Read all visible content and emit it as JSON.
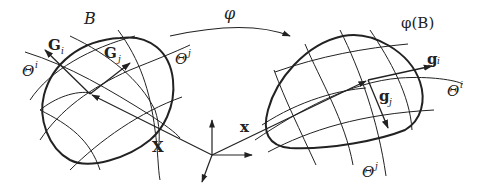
{
  "diagram": {
    "type": "continuum-mechanics-mapping",
    "colors": {
      "stroke": "#222222",
      "background": "#ffffff"
    },
    "reference_body": {
      "label": "B",
      "base_vectors": [
        {
          "label": "G",
          "sub": "i"
        },
        {
          "label": "G",
          "sub": "j"
        }
      ],
      "coord_lines": [
        {
          "label": "Θ",
          "sup": "i"
        },
        {
          "label": "Θ",
          "sup": "j"
        }
      ],
      "position_vector": "X"
    },
    "mapping": {
      "label": "φ"
    },
    "current_body": {
      "label": "φ(B)",
      "base_vectors": [
        {
          "label": "g",
          "sub": "i"
        },
        {
          "label": "g",
          "sub": "j"
        }
      ],
      "coord_lines": [
        {
          "label": "Θ",
          "sup": "i"
        },
        {
          "label": "Θ",
          "sup": "j"
        }
      ],
      "position_vector": "x"
    }
  }
}
